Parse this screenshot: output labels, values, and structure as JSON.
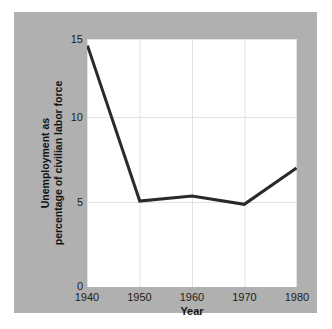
{
  "chart_data": {
    "type": "line",
    "title": "",
    "xlabel": "Year",
    "ylabel_line1": "Unemployment as",
    "ylabel_line2": "percentage of civilian labor force",
    "ylabel": "Unemployment as percentage of civilian labor force",
    "x": [
      1940,
      1950,
      1960,
      1970,
      1980
    ],
    "values": [
      14.6,
      5.2,
      5.5,
      5.0,
      7.2
    ],
    "series": [
      {
        "name": "Unemployment rate",
        "values": [
          14.6,
          5.2,
          5.5,
          5.0,
          7.2
        ]
      }
    ],
    "xticks": [
      "1940",
      "1950",
      "1960",
      "1970",
      "1980"
    ],
    "yticks": [
      "0",
      "5",
      "10",
      "15"
    ],
    "ytick_values": [
      0,
      5,
      10,
      15
    ],
    "xlim": [
      1940,
      1980
    ],
    "ylim": [
      0,
      15
    ],
    "grid": true,
    "legend": "none",
    "line_color": "#2a2a2a",
    "line_width": 3,
    "plot_background": "#ffffff",
    "grid_color": "#e2e2e2",
    "panel_color": "#b0b0b0",
    "figure_background": "#ffffff"
  }
}
